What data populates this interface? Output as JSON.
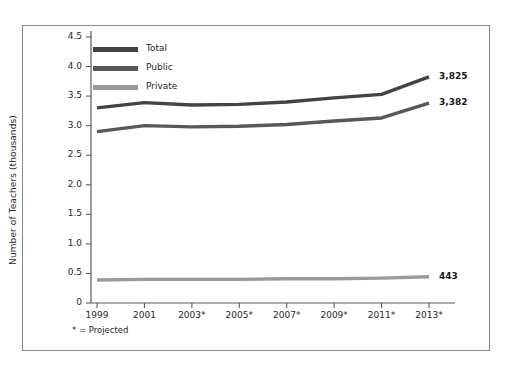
{
  "chart_data": {
    "type": "line",
    "title": "",
    "subtitle": "",
    "xlabel": "",
    "ylabel": "Number of Teachers (thousands)",
    "categories": [
      "1999",
      "2001",
      "2003*",
      "2005*",
      "2007*",
      "2009*",
      "2011*",
      "2013*"
    ],
    "x": [
      1999,
      2001,
      2003,
      2005,
      2007,
      2009,
      2011,
      2013
    ],
    "ylim": [
      0,
      4.5
    ],
    "xlim": [
      1999,
      2013
    ],
    "y_ticks": [
      "0",
      "0.5",
      "1.0",
      "1.5",
      "2.0",
      "2.5",
      "3.0",
      "3.5",
      "4.0",
      "4.5"
    ],
    "y_tick_values": [
      0,
      0.5,
      1.0,
      1.5,
      2.0,
      2.5,
      3.0,
      3.5,
      4.0,
      4.5
    ],
    "grid": false,
    "legend_position": "top-left",
    "series": [
      {
        "name": "Total",
        "color": "#434343",
        "values": [
          3.3,
          3.39,
          3.35,
          3.36,
          3.4,
          3.47,
          3.53,
          3.825
        ],
        "end_label": "3,825"
      },
      {
        "name": "Public",
        "color": "#585858",
        "values": [
          2.9,
          3.0,
          2.98,
          2.99,
          3.02,
          3.08,
          3.13,
          3.382
        ],
        "end_label": "3,382"
      },
      {
        "name": "Private",
        "color": "#9a9a9a",
        "values": [
          0.39,
          0.4,
          0.4,
          0.4,
          0.41,
          0.41,
          0.42,
          0.443
        ],
        "end_label": "443"
      }
    ],
    "annotations": [
      "* = Projected"
    ]
  },
  "legend": {
    "items": [
      {
        "label": "Total",
        "color": "#434343"
      },
      {
        "label": "Public",
        "color": "#585858"
      },
      {
        "label": "Private",
        "color": "#9a9a9a"
      }
    ]
  },
  "footnote": "* = Projected",
  "colors": {
    "frame": "#8a8a8a",
    "axis": "#5a5a5a",
    "text": "#262626",
    "background": "#ffffff"
  }
}
